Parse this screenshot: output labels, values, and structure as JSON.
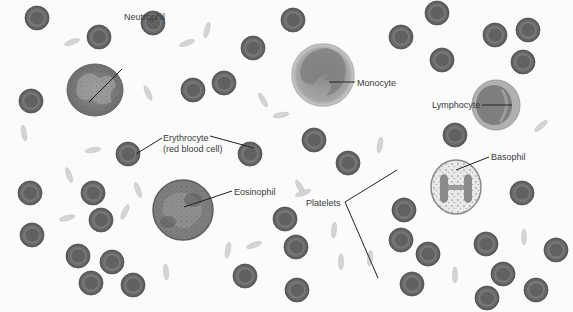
{
  "diagram": {
    "colors": {
      "background": "#fbfbfb",
      "rbc_fill": "#6c6c6c",
      "rbc_edge": "#555555",
      "rbc_center": "#585858",
      "platelet": "#cfcfcf",
      "leader_line": "#222222",
      "label_text": "#3a3a3a"
    },
    "labels": {
      "neutrophil": "Neutrophil",
      "monocyte": "Monocyte",
      "lymphocyte": "Lymphocyte",
      "erythrocyte_line1": "Erythrocyte",
      "erythrocyte_line2": "(red blood cell)",
      "eosinophil": "Eosinophil",
      "platelets": "Platelets",
      "basophil": "Basophil"
    }
  }
}
